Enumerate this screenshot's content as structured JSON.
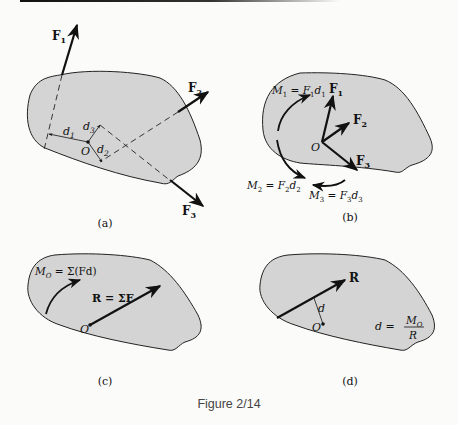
{
  "figure": {
    "caption": "Figure 2/14",
    "panels": {
      "a": {
        "label": "(a)",
        "point": "O",
        "forces": [
          "F",
          "F",
          "F"
        ],
        "force_subs": [
          "1",
          "2",
          "3"
        ],
        "distances": [
          "d",
          "d",
          "d"
        ],
        "distance_subs": [
          "1",
          "2",
          "3"
        ]
      },
      "b": {
        "label": "(b)",
        "point": "O",
        "forces": [
          "F",
          "F",
          "F"
        ],
        "force_subs": [
          "1",
          "2",
          "3"
        ],
        "moments": [
          {
            "lhs": "M",
            "sub": "1",
            "eq": " = F",
            "sub2": "1",
            "d": "d",
            "sub3": "1"
          },
          {
            "lhs": "M",
            "sub": "2",
            "eq": " = F",
            "sub2": "2",
            "d": "d",
            "sub3": "2"
          },
          {
            "lhs": "M",
            "sub": "3",
            "eq": " = F",
            "sub2": "3",
            "d": "d",
            "sub3": "3"
          }
        ]
      },
      "c": {
        "label": "(c)",
        "point": "O",
        "moment_lhs": "M",
        "moment_sub": "O",
        "moment_rhs": " = Σ(Fd)",
        "resultant": "R = ΣF"
      },
      "d": {
        "label": "(d)",
        "point": "O",
        "resultant": "R",
        "distance": "d",
        "formula_lhs": "d =",
        "formula_num": "M",
        "formula_num_sub": "O",
        "formula_den": "R"
      }
    }
  },
  "colors": {
    "body_fill": "#d4d4d4",
    "ink": "#111111",
    "background": "#fbfbfa"
  }
}
